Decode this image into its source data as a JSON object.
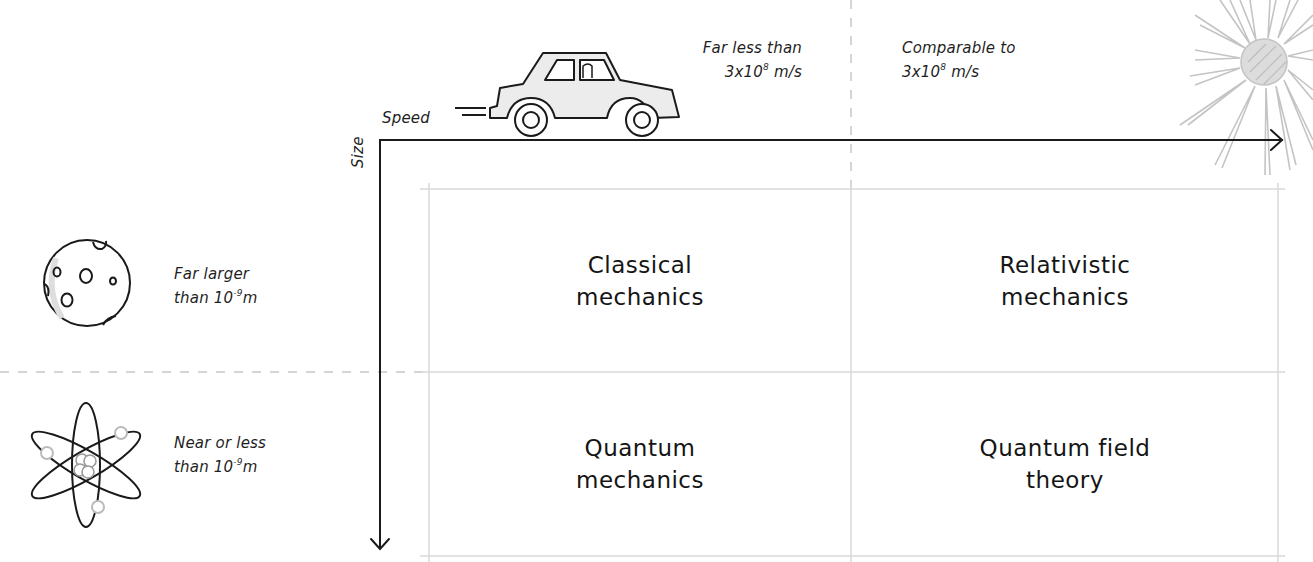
{
  "diagram": {
    "axes": {
      "x_label": "Speed",
      "y_label": "Size"
    },
    "speed_columns": [
      {
        "line1": "Far less than",
        "line2_base": "3x10",
        "line2_exp": "8",
        "line2_unit": " m/s",
        "icon": "car-icon"
      },
      {
        "line1": "Comparable to",
        "line2_base": "3x10",
        "line2_exp": "8",
        "line2_unit": " m/s",
        "icon": "light-burst-icon"
      }
    ],
    "size_rows": [
      {
        "line1": "Far larger",
        "line2_base": "than 10",
        "line2_exp": "-9",
        "line2_unit": "m",
        "icon": "moon-icon"
      },
      {
        "line1": "Near or less",
        "line2_base": "than 10",
        "line2_exp": "-9",
        "line2_unit": "m",
        "icon": "atom-icon"
      }
    ],
    "cells": [
      {
        "line1": "Classical",
        "line2": "mechanics"
      },
      {
        "line1": "Relativistic",
        "line2": "mechanics"
      },
      {
        "line1": "Quantum",
        "line2": "mechanics"
      },
      {
        "line1": "Quantum field",
        "line2": "theory"
      }
    ],
    "colors": {
      "axis": "#1a1a1a",
      "grid": "#d9d9d9",
      "dashed": "#c8c8c8",
      "sun": "#c4c4c4",
      "car_fill": "#e6e6e6"
    }
  }
}
